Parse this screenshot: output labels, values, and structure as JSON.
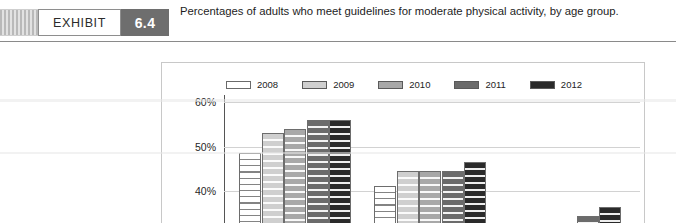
{
  "exhibit": {
    "label": "EXHIBIT",
    "number": "6.4",
    "caption": "Percentages of adults who meet guidelines for moderate physical activity, by age group."
  },
  "chart_data": {
    "type": "bar",
    "title": "Percentages of adults who meet guidelines for moderate physical activity, by age group.",
    "xlabel": "",
    "ylabel": "",
    "ylim": [
      20,
      62
    ],
    "grid": true,
    "legend_position": "top-center",
    "ytick_labels": [
      "60%",
      "50%",
      "40%",
      "30%"
    ],
    "ytick_values": [
      60,
      50,
      40,
      30
    ],
    "categories": [
      "18-44 years",
      "45-64 years",
      "65 years and over"
    ],
    "series": [
      {
        "name": "2008",
        "color": "#ffffff",
        "values": [
          48.7,
          41.2,
          28.5
        ]
      },
      {
        "name": "2009",
        "color": "#cfcfcf",
        "values": [
          53.0,
          44.5,
          32.5
        ]
      },
      {
        "name": "2010",
        "color": "#a8a8a8",
        "values": [
          54.0,
          44.5,
          29.5
        ]
      },
      {
        "name": "2011",
        "color": "#6b6b6b",
        "values": [
          56.0,
          44.5,
          34.5
        ]
      },
      {
        "name": "2012",
        "color": "#2a2a2a",
        "values": [
          56.0,
          46.5,
          36.5
        ]
      }
    ]
  }
}
